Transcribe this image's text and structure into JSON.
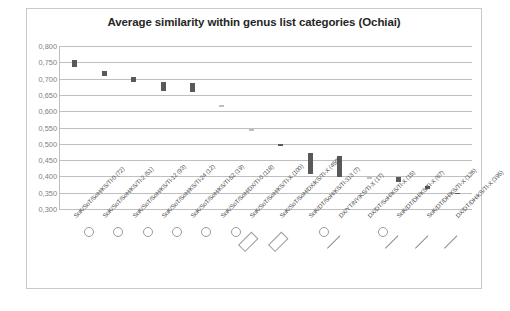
{
  "chart_data": {
    "type": "bar",
    "title": "Average similarity within genus list categories (Ochiai)",
    "xlabel": "",
    "ylabel": "",
    "ylim": [
      0.3,
      0.8
    ],
    "ytick_step": 0.05,
    "decimal_separator": ",",
    "grid": true,
    "legend": "none",
    "bar_style": "floating-range",
    "ytick_labels": [
      "0,800",
      "0,750",
      "0,700",
      "0,650",
      "0,600",
      "0,550",
      "0,500",
      "0,450",
      "0,400",
      "0,350",
      "0,300"
    ],
    "categories": [
      "SoK/SoT/SoH/KS/Tl-0 (72)",
      "SoK/SoT/SoH/KS/Tl-2 (51)",
      "SoK/SoT/SoH/KS/Tl-12 (93)",
      "SoK/SoT/SoH/KS/Tl-24 (12)",
      "SoK/SoT/SoH/KS/Tl-52 (19)",
      "SoK/SoT/SoH/DX/Tl-0 (118)",
      "SoK/SoT/SoH/KS/Tl-X (100)",
      "SoK/SoT/SoH/DX/KS/Tl-X (450)",
      "SoK/DT/SoH/KS/Tl-313 (7)",
      "DX/YT/NY/KS/Tl-X (17)",
      "DX/DT/SoH/KS/Tl-X (15)",
      "SoK/DT/DH/KS/Tl-X (67)",
      "SoK/DT/DH/KS/Tl-X (136)",
      "DX/DT/DH/KS/Tl-X (395)"
    ],
    "series": [
      {
        "name": "similarity range",
        "low": [
          0.735,
          0.708,
          0.69,
          0.662,
          0.658,
          0.612,
          0.538,
          0.492,
          0.408,
          0.398,
          0.392,
          0.382,
          0.36,
          0.346
        ],
        "high": [
          0.757,
          0.722,
          0.704,
          0.69,
          0.688,
          0.62,
          0.546,
          0.498,
          0.472,
          0.462,
          0.402,
          0.398,
          0.372,
          0.35
        ]
      }
    ],
    "bar_colors": [
      "dark",
      "dark",
      "dark",
      "dark",
      "dark",
      "light",
      "light",
      "dark",
      "dark",
      "dark",
      "light",
      "dark",
      "dark",
      "dark"
    ],
    "color_dark": "#595959",
    "color_light": "#bfbfbf",
    "annotations": [
      {
        "index": 0,
        "mark": "circle"
      },
      {
        "index": 1,
        "mark": "circle"
      },
      {
        "index": 2,
        "mark": "circle"
      },
      {
        "index": 3,
        "mark": "circle"
      },
      {
        "index": 4,
        "mark": "circle"
      },
      {
        "index": 5,
        "mark": "circle"
      },
      {
        "index": 6,
        "mark": "box"
      },
      {
        "index": 7,
        "mark": "box"
      },
      {
        "index": 8,
        "mark": "circle"
      },
      {
        "index": 9,
        "mark": "underline"
      },
      {
        "index": 10,
        "mark": "circle"
      },
      {
        "index": 11,
        "mark": "underline"
      },
      {
        "index": 12,
        "mark": "underline"
      },
      {
        "index": 13,
        "mark": "underline"
      }
    ]
  }
}
